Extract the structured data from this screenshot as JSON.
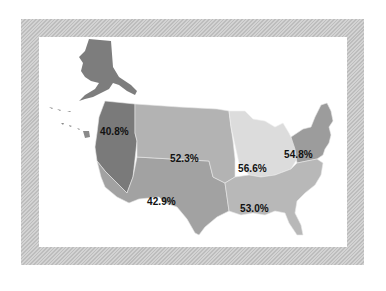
{
  "map": {
    "type": "choropleth",
    "subject": "United States regions",
    "frame_style": "diagonal-hatched gray border",
    "regions": [
      {
        "id": "pacific-northwest",
        "label": "40.8%",
        "value": 40.8,
        "color": "#7a7a7a"
      },
      {
        "id": "mountain-plains",
        "label": "52.3%",
        "value": 52.3,
        "color": "#b3b3b3"
      },
      {
        "id": "southwest",
        "label": "42.9%",
        "value": 42.9,
        "color": "#a2a2a2"
      },
      {
        "id": "midwest",
        "label": "56.6%",
        "value": 56.6,
        "color": "#dcdcdc"
      },
      {
        "id": "northeast",
        "label": "54.8%",
        "value": 54.8,
        "color": "#9c9c9c"
      },
      {
        "id": "southeast",
        "label": "53.0%",
        "value": 53.0,
        "color": "#b8b8b8"
      }
    ],
    "alaska_color": "#7d7d7d",
    "hawaii_color": "#8a8a8a"
  }
}
